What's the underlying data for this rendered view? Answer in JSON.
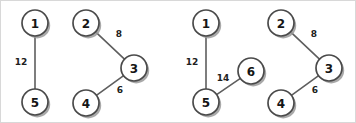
{
  "figure": {
    "background_color": "#ffffff",
    "border_color": "#d8d8d8",
    "node_fill": "#ffffff",
    "node_stroke": "#4a4a4a",
    "node_shadow": "#9a9a9a",
    "edge_color": "#5e5e5e",
    "label_color": "#151515",
    "node_radius": 13
  },
  "graphs": [
    {
      "name": "left-graph",
      "nodes": [
        {
          "id": "1",
          "label": "1",
          "x": 34,
          "y": 22
        },
        {
          "id": "5",
          "label": "5",
          "x": 34,
          "y": 101
        },
        {
          "id": "2",
          "label": "2",
          "x": 85,
          "y": 22
        },
        {
          "id": "3",
          "label": "3",
          "x": 133,
          "y": 67
        },
        {
          "id": "4",
          "label": "4",
          "x": 85,
          "y": 102
        }
      ],
      "edges": [
        {
          "from": "1",
          "to": "5",
          "weight": "12",
          "lx": 20,
          "ly": 61
        },
        {
          "from": "2",
          "to": "3",
          "weight": "8",
          "lx": 118,
          "ly": 33
        },
        {
          "from": "4",
          "to": "3",
          "weight": "6",
          "lx": 119,
          "ly": 89
        }
      ]
    },
    {
      "name": "right-graph",
      "nodes": [
        {
          "id": "1",
          "label": "1",
          "x": 205,
          "y": 22
        },
        {
          "id": "5",
          "label": "5",
          "x": 205,
          "y": 101
        },
        {
          "id": "6",
          "label": "6",
          "x": 250,
          "y": 70
        },
        {
          "id": "2",
          "label": "2",
          "x": 280,
          "y": 22
        },
        {
          "id": "3",
          "label": "3",
          "x": 328,
          "y": 67
        },
        {
          "id": "4",
          "label": "4",
          "x": 280,
          "y": 102
        }
      ],
      "edges": [
        {
          "from": "1",
          "to": "5",
          "weight": "12",
          "lx": 191,
          "ly": 61
        },
        {
          "from": "5",
          "to": "6",
          "weight": "14",
          "lx": 222,
          "ly": 77
        },
        {
          "from": "2",
          "to": "3",
          "weight": "8",
          "lx": 313,
          "ly": 33
        },
        {
          "from": "4",
          "to": "3",
          "weight": "6",
          "lx": 314,
          "ly": 89
        }
      ]
    }
  ]
}
